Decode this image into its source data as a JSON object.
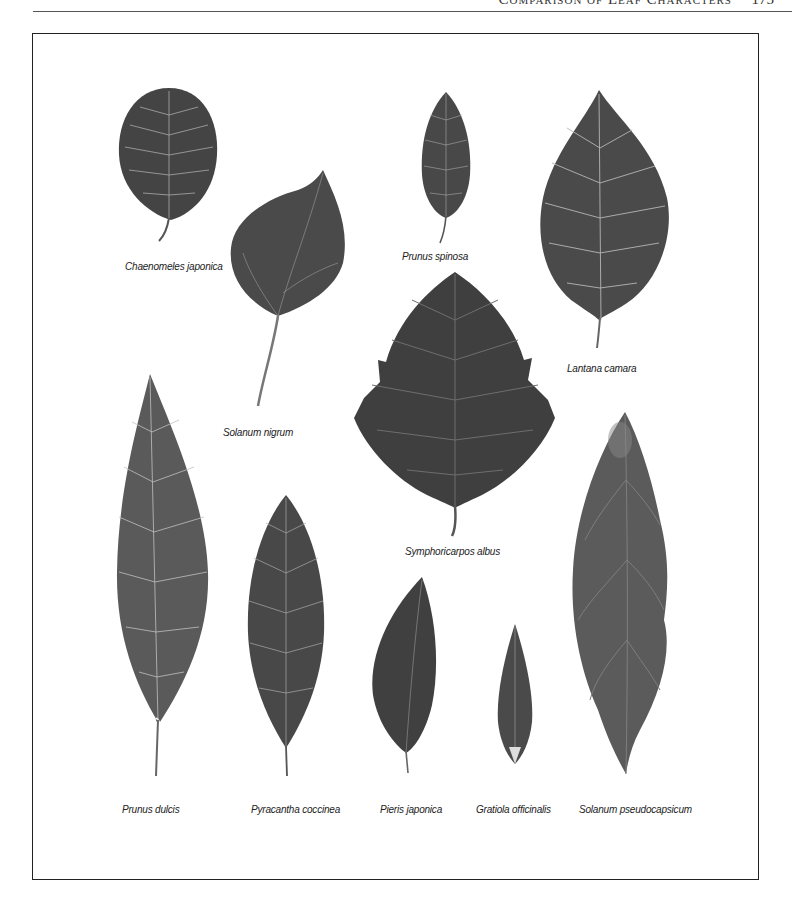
{
  "header": {
    "title": "Comparison of Leaf Characters",
    "page_number": "175"
  },
  "figure": {
    "leaves": [
      {
        "id": "chaenomeles",
        "label": "Chaenomeles japonica"
      },
      {
        "id": "solanum-nigrum",
        "label": "Solanum nigrum"
      },
      {
        "id": "prunus-spinosa",
        "label": "Prunus spinosa"
      },
      {
        "id": "lantana",
        "label": "Lantana camara"
      },
      {
        "id": "symphoricarpos",
        "label": "Symphoricarpos albus"
      },
      {
        "id": "prunus-dulcis",
        "label": "Prunus dulcis"
      },
      {
        "id": "pyracantha",
        "label": "Pyracantha coccinea"
      },
      {
        "id": "pieris",
        "label": "Pieris japonica"
      },
      {
        "id": "gratiola",
        "label": "Gratiola officinalis"
      },
      {
        "id": "solanum-pseudocapsicum",
        "label": "Solanum pseudocapsicum"
      }
    ],
    "colors": {
      "leaf_dark": "#3a3a3a",
      "leaf_mid": "#555555",
      "leaf_light": "#7a7a7a",
      "vein": "#bdbdbd"
    }
  }
}
